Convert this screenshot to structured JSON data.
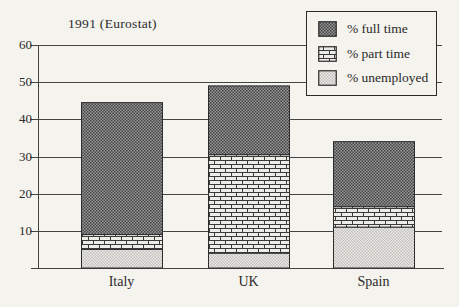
{
  "figure": {
    "title": "1991 (Eurostat)"
  },
  "chart_data": {
    "type": "bar",
    "stacked": true,
    "title": "1991 (Eurostat)",
    "categories": [
      "Italy",
      "UK",
      "Spain"
    ],
    "series": [
      {
        "name": "% full time",
        "pattern": "dark-checker",
        "values": [
          35.5,
          18.5,
          17.5
        ]
      },
      {
        "name": "% part time",
        "pattern": "brick",
        "values": [
          4,
          26.5,
          5.5
        ]
      },
      {
        "name": "% unemployed",
        "pattern": "light-checker",
        "values": [
          5,
          4,
          11
        ]
      }
    ],
    "stack_order_bottom_to_top": [
      "% unemployed",
      "% part time",
      "% full time"
    ],
    "totals": [
      44.5,
      49,
      34
    ],
    "xlabel": "",
    "ylabel": "",
    "ylim": [
      0,
      60
    ],
    "y_ticks": [
      10,
      20,
      30,
      40,
      50,
      60
    ],
    "grid": true,
    "legend_position": "top-right"
  },
  "colors": {
    "paper": "#f5f3ee",
    "line": "#444444",
    "bar_border": "#2d2d2d",
    "text": "#2a2a2a",
    "dark_fill_a": "#474747",
    "dark_fill_b": "#969696",
    "light_fill_a": "#c0bfbb",
    "light_fill_b": "#eeece7",
    "brick_bg": "#eeece7",
    "brick_line": "#3a3a3a"
  }
}
